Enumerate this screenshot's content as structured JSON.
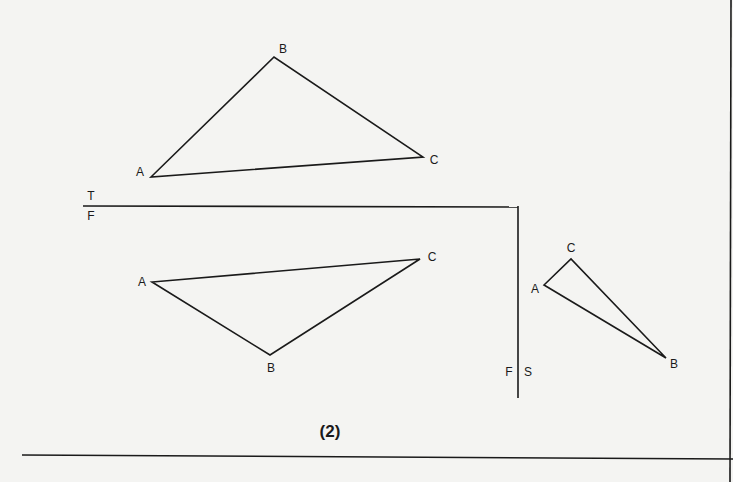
{
  "figure": {
    "caption": "(2)",
    "fold_lines": {
      "top_front": {
        "upper_label": "T",
        "lower_label": "F"
      },
      "front_side": {
        "left_label": "F",
        "right_label": "S"
      }
    },
    "views": {
      "top": {
        "name": "Top view",
        "vertices": [
          {
            "label": "A",
            "x": 151,
            "y": 177,
            "lx": 140,
            "ly": 172
          },
          {
            "label": "B",
            "x": 274,
            "y": 57,
            "lx": 283,
            "ly": 49
          },
          {
            "label": "C",
            "x": 423,
            "y": 157,
            "lx": 434,
            "ly": 160
          }
        ]
      },
      "front": {
        "name": "Front view",
        "vertices": [
          {
            "label": "A",
            "x": 152,
            "y": 282,
            "lx": 142,
            "ly": 282
          },
          {
            "label": "B",
            "x": 270,
            "y": 355,
            "lx": 271,
            "ly": 368
          },
          {
            "label": "C",
            "x": 420,
            "y": 259,
            "lx": 432,
            "ly": 257
          }
        ]
      },
      "side": {
        "name": "Side view",
        "vertices": [
          {
            "label": "A",
            "x": 544,
            "y": 285,
            "lx": 535,
            "ly": 289
          },
          {
            "label": "B",
            "x": 666,
            "y": 358,
            "lx": 674,
            "ly": 364
          },
          {
            "label": "C",
            "x": 571,
            "y": 259,
            "lx": 571,
            "ly": 248
          }
        ]
      }
    }
  }
}
